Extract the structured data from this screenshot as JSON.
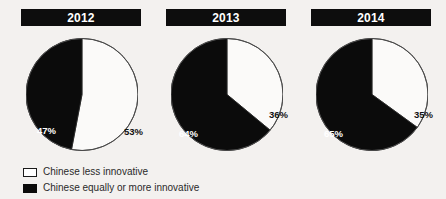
{
  "chart_data": {
    "type": "pie",
    "title": "",
    "legend_position": "bottom-left",
    "series_labels": [
      "Chinese less innovative",
      "Chinese equally or more innovative"
    ],
    "colors": {
      "less_innovative": "#ffffff",
      "equally_or_more_innovative": "#0b0b0b",
      "background": "#f3f1ef",
      "outline": "#4a4a4a"
    },
    "charts": [
      {
        "year": "2012",
        "slices": [
          {
            "label": "Chinese less innovative",
            "value": 53,
            "value_label": "53%",
            "color": "#ffffff"
          },
          {
            "label": "Chinese equally or more innovative",
            "value": 47,
            "value_label": "47%",
            "color": "#0b0b0b"
          }
        ]
      },
      {
        "year": "2013",
        "slices": [
          {
            "label": "Chinese less innovative",
            "value": 36,
            "value_label": "36%",
            "color": "#ffffff"
          },
          {
            "label": "Chinese equally or more innovative",
            "value": 64,
            "value_label": "64%",
            "color": "#0b0b0b"
          }
        ]
      },
      {
        "year": "2014",
        "slices": [
          {
            "label": "Chinese less innovative",
            "value": 35,
            "value_label": "35%",
            "color": "#ffffff"
          },
          {
            "label": "Chinese equally or more innovative",
            "value": 65,
            "value_label": "65%",
            "color": "#0b0b0b"
          }
        ]
      }
    ]
  },
  "panels": [
    {
      "year": "2012",
      "light_pct": "53%",
      "dark_pct": "47%",
      "light_pct_pos": {
        "left": 98,
        "top": 89
      },
      "dark_pct_pos": {
        "left": 11,
        "top": 88
      }
    },
    {
      "year": "2013",
      "light_pct": "36%",
      "dark_pct": "64%",
      "light_pct_pos": {
        "left": 98,
        "top": 72
      },
      "dark_pct_pos": {
        "left": 8,
        "top": 91
      }
    },
    {
      "year": "2014",
      "light_pct": "35%",
      "dark_pct": "65%",
      "light_pct_pos": {
        "left": 98,
        "top": 72
      },
      "dark_pct_pos": {
        "left": 8,
        "top": 91
      }
    }
  ],
  "legend": {
    "items": [
      {
        "swatch": "white-square",
        "label": "Chinese less innovative"
      },
      {
        "swatch": "black-square",
        "label": "Chinese equally or more innovative"
      }
    ]
  }
}
